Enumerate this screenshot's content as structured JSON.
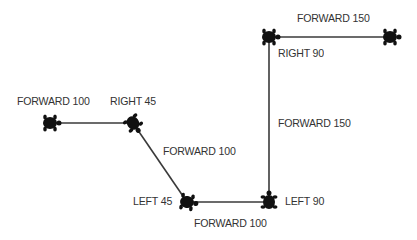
{
  "diagram": {
    "line_color": "#3a3a3a",
    "turtle_color": "#111111",
    "steps": [
      {
        "command": "FORWARD 100"
      },
      {
        "command": "RIGHT 45"
      },
      {
        "command": "FORWARD 100"
      },
      {
        "command": "LEFT 45"
      },
      {
        "command": "FORWARD 100"
      },
      {
        "command": "LEFT 90"
      },
      {
        "command": "FORWARD 150"
      },
      {
        "command": "RIGHT 90"
      },
      {
        "command": "FORWARD 150"
      }
    ]
  }
}
